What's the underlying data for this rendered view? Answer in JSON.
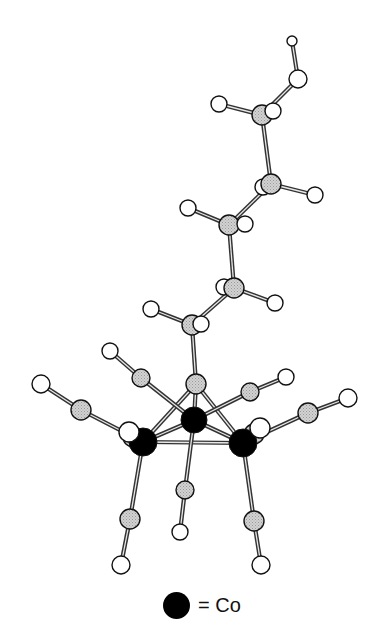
{
  "figure": {
    "type": "molecular-structure",
    "colors": {
      "cobalt": "#000000",
      "carbon": "#c8c8c8",
      "oxygen_hydrogen": "#ffffff",
      "bond": "#333333"
    }
  },
  "legend": {
    "symbol": "black-filled-circle",
    "label": "= Co"
  },
  "atoms": [
    {
      "id": "h_oh",
      "el": "H",
      "x": 292,
      "y": 41,
      "r": 5
    },
    {
      "id": "o_oh",
      "el": "O",
      "x": 298,
      "y": 79,
      "r": 9
    },
    {
      "id": "c6",
      "el": "C",
      "x": 262,
      "y": 115,
      "r": 10
    },
    {
      "id": "h6b",
      "el": "H",
      "x": 273,
      "y": 111,
      "r": 8,
      "front": true
    },
    {
      "id": "h6a",
      "el": "H",
      "x": 219,
      "y": 104,
      "r": 8
    },
    {
      "id": "h5b",
      "el": "H",
      "x": 263,
      "y": 187,
      "r": 8
    },
    {
      "id": "c5",
      "el": "C",
      "x": 271,
      "y": 184,
      "r": 10
    },
    {
      "id": "h5a",
      "el": "H",
      "x": 315,
      "y": 195,
      "r": 8
    },
    {
      "id": "c4",
      "el": "C",
      "x": 229,
      "y": 225,
      "r": 10
    },
    {
      "id": "h4b",
      "el": "H",
      "x": 245,
      "y": 224,
      "r": 8,
      "front": true
    },
    {
      "id": "h4a",
      "el": "H",
      "x": 188,
      "y": 208,
      "r": 8
    },
    {
      "id": "h3b",
      "el": "H",
      "x": 224,
      "y": 287,
      "r": 8
    },
    {
      "id": "c3",
      "el": "C",
      "x": 234,
      "y": 288,
      "r": 10
    },
    {
      "id": "h3a",
      "el": "H",
      "x": 275,
      "y": 303,
      "r": 8
    },
    {
      "id": "c2",
      "el": "C",
      "x": 192,
      "y": 325,
      "r": 10
    },
    {
      "id": "h2b",
      "el": "H",
      "x": 201,
      "y": 324,
      "r": 8,
      "front": true
    },
    {
      "id": "h2a",
      "el": "H",
      "x": 151,
      "y": 309,
      "r": 8
    },
    {
      "id": "c1",
      "el": "C",
      "x": 196,
      "y": 384,
      "r": 10
    },
    {
      "id": "co_a_o",
      "el": "O",
      "x": 110,
      "y": 351,
      "r": 8
    },
    {
      "id": "co_a_c",
      "el": "C",
      "x": 141,
      "y": 378,
      "r": 9
    },
    {
      "id": "co_b_o",
      "el": "O",
      "x": 41,
      "y": 384,
      "r": 9
    },
    {
      "id": "co_b_c",
      "el": "C",
      "x": 81,
      "y": 410,
      "r": 10
    },
    {
      "id": "co_c_o",
      "el": "O",
      "x": 286,
      "y": 377,
      "r": 8
    },
    {
      "id": "co_c_c",
      "el": "C",
      "x": 250,
      "y": 392,
      "r": 9
    },
    {
      "id": "co_d_o",
      "el": "O",
      "x": 348,
      "y": 398,
      "r": 9
    },
    {
      "id": "co_d_c",
      "el": "C",
      "x": 308,
      "y": 413,
      "r": 10
    },
    {
      "id": "co_mid",
      "el": "Co",
      "x": 194,
      "y": 420,
      "r": 13
    },
    {
      "id": "co_e_c",
      "el": "C",
      "x": 133,
      "y": 437,
      "r": 10
    },
    {
      "id": "co_e_o",
      "el": "O",
      "x": 129,
      "y": 432,
      "r": 10,
      "front": true
    },
    {
      "id": "co_left",
      "el": "Co",
      "x": 143,
      "y": 442,
      "r": 14
    },
    {
      "id": "co_f_c",
      "el": "C",
      "x": 254,
      "y": 434,
      "r": 10
    },
    {
      "id": "co_right",
      "el": "Co",
      "x": 243,
      "y": 443,
      "r": 14
    },
    {
      "id": "co_f_o",
      "el": "O",
      "x": 260,
      "y": 428,
      "r": 10,
      "front": true
    },
    {
      "id": "co_g_c",
      "el": "C",
      "x": 185,
      "y": 490,
      "r": 9
    },
    {
      "id": "co_g_o",
      "el": "O",
      "x": 180,
      "y": 532,
      "r": 8
    },
    {
      "id": "co_h_c",
      "el": "C",
      "x": 130,
      "y": 519,
      "r": 10
    },
    {
      "id": "co_h_o",
      "el": "O",
      "x": 121,
      "y": 565,
      "r": 9
    },
    {
      "id": "co_i_c",
      "el": "C",
      "x": 254,
      "y": 521,
      "r": 10
    },
    {
      "id": "co_i_o",
      "el": "O",
      "x": 261,
      "y": 565,
      "r": 9
    }
  ],
  "bonds": [
    [
      "h_oh",
      "o_oh"
    ],
    [
      "o_oh",
      "c6"
    ],
    [
      "c6",
      "h6a"
    ],
    [
      "c6",
      "h6b"
    ],
    [
      "c6",
      "c5"
    ],
    [
      "c5",
      "h5a"
    ],
    [
      "c5",
      "h5b"
    ],
    [
      "c5",
      "c4"
    ],
    [
      "c4",
      "h4a"
    ],
    [
      "c4",
      "h4b"
    ],
    [
      "c4",
      "c3"
    ],
    [
      "c3",
      "h3a"
    ],
    [
      "c3",
      "h3b"
    ],
    [
      "c3",
      "c2"
    ],
    [
      "c2",
      "h2a"
    ],
    [
      "c2",
      "h2b"
    ],
    [
      "c2",
      "c1"
    ],
    [
      "c1",
      "co_mid"
    ],
    [
      "c1",
      "co_left"
    ],
    [
      "c1",
      "co_right"
    ],
    [
      "co_mid",
      "co_left"
    ],
    [
      "co_mid",
      "co_right"
    ],
    [
      "co_left",
      "co_right"
    ],
    [
      "co_mid",
      "co_a_c"
    ],
    [
      "co_a_c",
      "co_a_o"
    ],
    [
      "co_left",
      "co_b_c"
    ],
    [
      "co_b_c",
      "co_b_o"
    ],
    [
      "co_mid",
      "co_c_c"
    ],
    [
      "co_c_c",
      "co_c_o"
    ],
    [
      "co_right",
      "co_d_c"
    ],
    [
      "co_d_c",
      "co_d_o"
    ],
    [
      "co_left",
      "co_e_c"
    ],
    [
      "co_right",
      "co_f_c"
    ],
    [
      "co_mid",
      "co_g_c"
    ],
    [
      "co_g_c",
      "co_g_o"
    ],
    [
      "co_left",
      "co_h_c"
    ],
    [
      "co_h_c",
      "co_h_o"
    ],
    [
      "co_right",
      "co_i_c"
    ],
    [
      "co_i_c",
      "co_i_o"
    ]
  ]
}
